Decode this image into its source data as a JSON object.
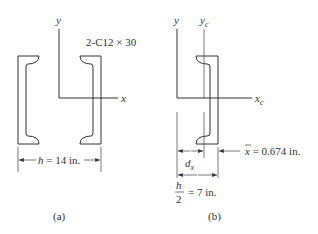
{
  "figure": {
    "panel_a": {
      "caption": "(a)",
      "section_label": "2-C12 × 30",
      "axis_x_label": "x",
      "axis_y_label": "y",
      "dimension": {
        "symbol": "h",
        "text": " = 14 in."
      }
    },
    "panel_b": {
      "caption": "(b)",
      "axis_y_label": "y",
      "axis_yc_label": "y",
      "axis_yc_sub": "c",
      "axis_xc_label": "x",
      "axis_xc_sub": "c",
      "dx_symbol": "d",
      "dx_sub": "x",
      "centroid_dim": {
        "symbol": "x",
        "text": " = 0.674 in."
      },
      "half_h": {
        "numerator": "h",
        "denominator": "2",
        "text": "= 7 in."
      }
    },
    "colors": {
      "line": "#333333",
      "background": "#ffffff"
    }
  }
}
